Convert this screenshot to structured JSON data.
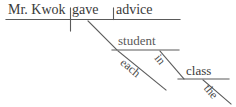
{
  "diagram": {
    "type": "reed-kellogg-sentence-diagram",
    "sentence": "Mr. Kwok gave each student in the class advice.",
    "stroke_color": "#5a5a5a",
    "text_color": "#3a3a3a",
    "background_color": "#ffffff",
    "words": {
      "subject": "Mr. Kwok",
      "verb": "gave",
      "direct_object": "advice",
      "indirect_object": "student",
      "indirect_object_determiner": "each",
      "preposition": "in",
      "prepositional_object": "class",
      "prepositional_object_determiner": "the"
    }
  }
}
